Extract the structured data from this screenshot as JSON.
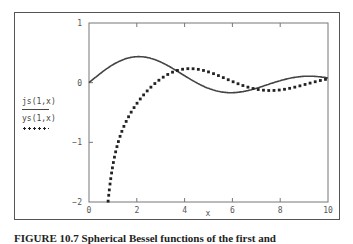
{
  "chart_data": {
    "type": "line",
    "title": "",
    "xlabel": "x",
    "ylabel": "",
    "xlim": [
      0,
      10
    ],
    "ylim": [
      -2,
      1
    ],
    "x_ticks": [
      "0",
      "2",
      "4",
      "6",
      "8",
      "10"
    ],
    "y_ticks": [
      "1",
      "0",
      "-1",
      "-2"
    ],
    "grid": false,
    "legend_position": "left",
    "series": [
      {
        "name": "js(1,x)",
        "style": "solid",
        "x": [
          0,
          1,
          2,
          3,
          4,
          5,
          6,
          7,
          8,
          9,
          10
        ],
        "values": [
          0,
          0.3,
          0.44,
          0.35,
          0.12,
          -0.1,
          -0.17,
          -0.09,
          0.04,
          0.11,
          0.08
        ]
      },
      {
        "name": "ys(1,x)",
        "style": "dotted",
        "x": [
          0.8,
          1,
          1.5,
          2,
          2.5,
          3,
          4,
          5,
          6,
          7,
          8,
          9,
          10
        ],
        "values": [
          -2.0,
          -1.38,
          -0.69,
          -0.35,
          -0.16,
          -0.06,
          0.25,
          0.26,
          0.03,
          -0.09,
          -0.13,
          -0.03,
          0.06
        ]
      }
    ]
  },
  "legend": {
    "series1_label": "js(1,x)",
    "series2_label": "ys(1,x)"
  },
  "axes": {
    "x_label": "x",
    "x_ticks": [
      "0",
      "2",
      "4",
      "6",
      "8",
      "10"
    ],
    "y_ticks": [
      "1",
      "0",
      "−1",
      "−2"
    ]
  },
  "caption": "FIGURE 10.7 Spherical Bessel functions of the first and"
}
